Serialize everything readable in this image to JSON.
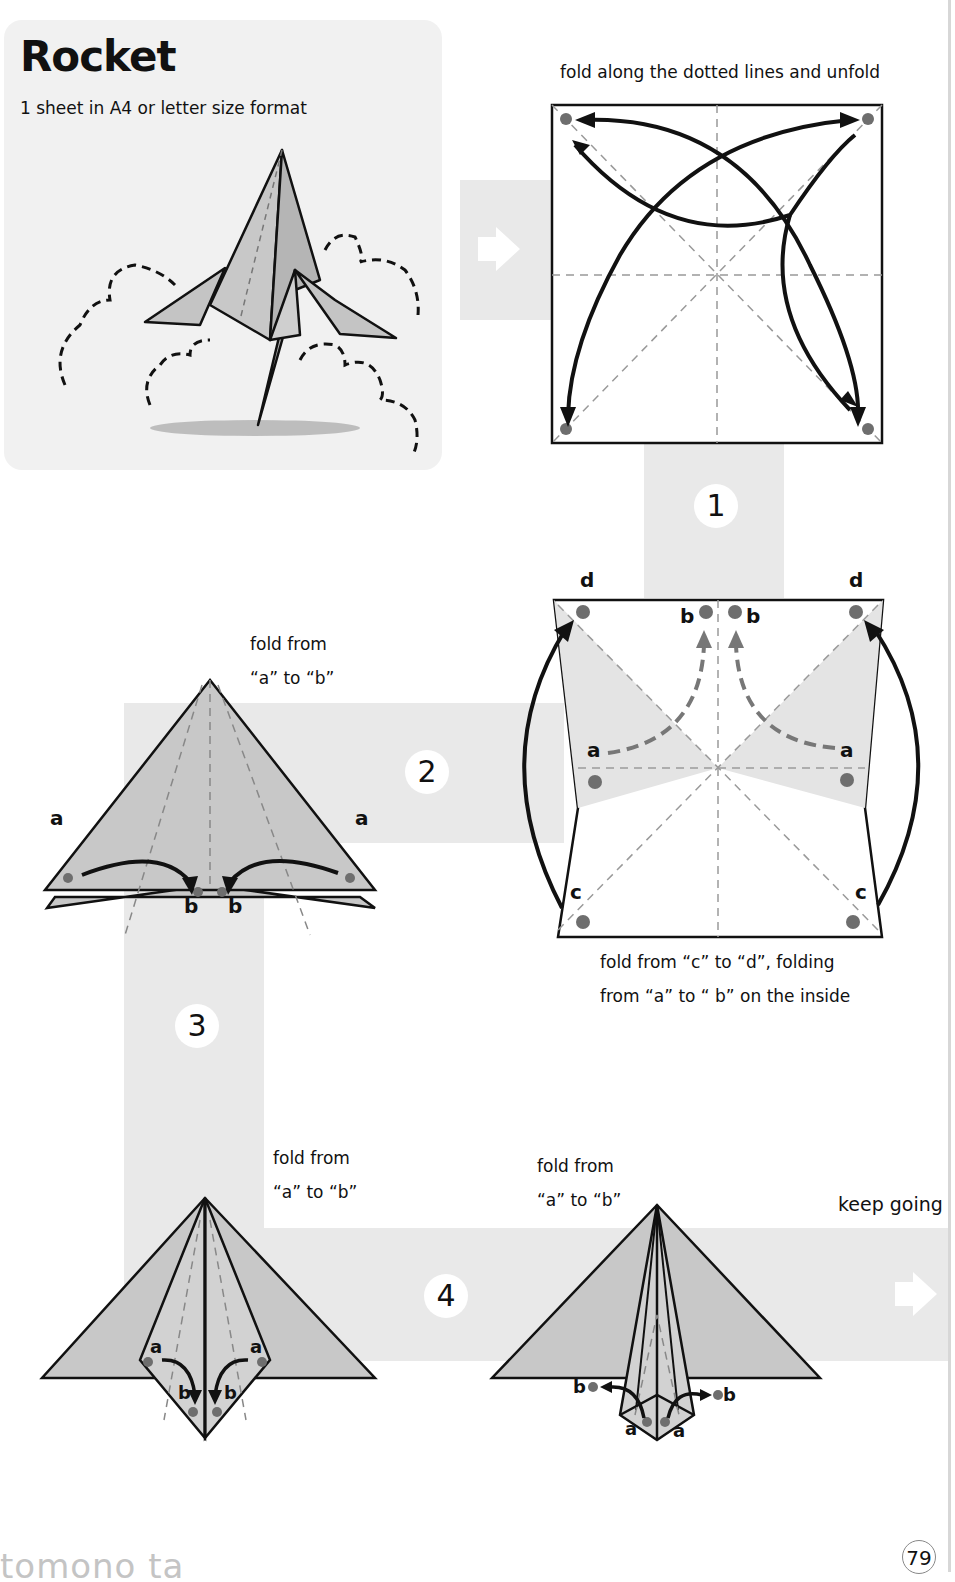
{
  "header": {
    "title": "Rocket",
    "subtitle": "1 sheet in A4 or letter size format"
  },
  "colors": {
    "band": "#e9e9e9",
    "paper_gray": "#c8c8c8",
    "paper_light": "#efefef",
    "dot": "#6e6e6e",
    "line": "#111111"
  },
  "steps": [
    {
      "number": "1",
      "caption": "fold along the dotted lines and unfold",
      "icon": "square-sheet-fold-diagram"
    },
    {
      "number": "",
      "caption_line1": "fold from “c” to “d”, folding",
      "caption_line2": "from “a” to “ b” on the inside",
      "labels": {
        "d_left": "d",
        "d_right": "d",
        "b_left": "b",
        "b_right": "b",
        "a_left": "a",
        "a_right": "a",
        "c_left": "c",
        "c_right": "c"
      }
    },
    {
      "number": "2",
      "caption_line1": "fold from",
      "caption_line2": "“a” to “b”",
      "labels": {
        "a_left": "a",
        "a_right": "a",
        "b_left": "b",
        "b_right": "b"
      }
    },
    {
      "number": "3",
      "caption_line1": "fold from",
      "caption_line2": "“a” to “b”",
      "labels": {
        "a_left": "a",
        "a_right": "a",
        "b_left": "b",
        "b_right": "b"
      }
    },
    {
      "number": "4",
      "caption_line1": "fold from",
      "caption_line2": "“a” to “b”",
      "labels": {
        "a_left": "a",
        "a_right": "a",
        "b_left": "b",
        "b_right": "b"
      }
    }
  ],
  "nav": {
    "keep_going": "keep going",
    "arrow_icon": "right-arrow-icon"
  },
  "footer": {
    "brand": "tomono ta",
    "page_number": "79"
  }
}
